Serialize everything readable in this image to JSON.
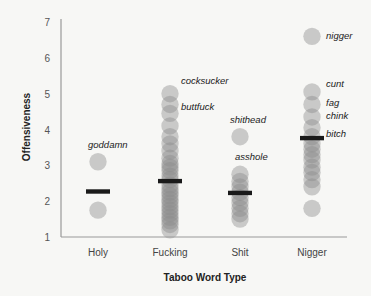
{
  "chart_data": {
    "type": "scatter",
    "title": "",
    "xlabel": "Taboo Word Type",
    "ylabel": "Offensiveness",
    "ylim": [
      1,
      7
    ],
    "yticks": [
      1,
      2,
      3,
      4,
      5,
      6,
      7
    ],
    "grid": false,
    "legend": null,
    "categories": [
      "Holy",
      "Fucking",
      "Shit",
      "Nigger"
    ],
    "means": [
      2.27,
      2.56,
      2.23,
      3.76
    ],
    "points": [
      {
        "category": "Holy",
        "values": [
          3.1,
          1.75
        ]
      },
      {
        "category": "Fucking",
        "values": [
          5.0,
          4.7,
          4.45,
          4.1,
          3.8,
          3.6,
          3.4,
          3.2,
          3.05,
          2.95,
          2.85,
          2.7,
          2.6,
          2.45,
          2.35,
          2.25,
          2.15,
          2.05,
          1.95,
          1.85,
          1.75,
          1.65,
          1.55,
          1.45,
          1.35,
          1.2
        ]
      },
      {
        "category": "Shit",
        "values": [
          3.8,
          2.75,
          2.55,
          2.4,
          2.25,
          2.1,
          1.95,
          1.8,
          1.65,
          1.5
        ]
      },
      {
        "category": "Nigger",
        "values": [
          6.6,
          5.05,
          4.7,
          4.35,
          4.05,
          3.8,
          3.6,
          3.45,
          3.3,
          3.15,
          2.95,
          2.8,
          2.6,
          2.4,
          1.8
        ]
      }
    ],
    "annotations": [
      {
        "text": "goddamn",
        "category": "Holy",
        "value": 3.1
      },
      {
        "text": "cocksucker",
        "category": "Fucking",
        "value": 5.0
      },
      {
        "text": "buttfuck",
        "category": "Fucking",
        "value": 4.45
      },
      {
        "text": "shithead",
        "category": "Shit",
        "value": 3.8
      },
      {
        "text": "asshole",
        "category": "Shit",
        "value": 2.75
      },
      {
        "text": "nigger",
        "category": "Nigger",
        "value": 6.6
      },
      {
        "text": "cunt",
        "category": "Nigger",
        "value": 5.05
      },
      {
        "text": "fag",
        "category": "Nigger",
        "value": 4.5
      },
      {
        "text": "chink",
        "category": "Nigger",
        "value": 4.05
      },
      {
        "text": "bitch",
        "category": "Nigger",
        "value": 3.6
      }
    ]
  },
  "colors": {
    "point": "#8a8a8a",
    "mean_bar": "#1a1a1a",
    "axis": "#999999",
    "background": "#f7f7f5"
  }
}
